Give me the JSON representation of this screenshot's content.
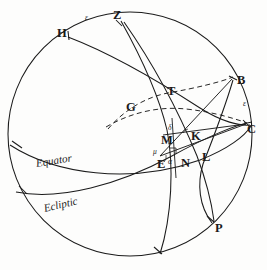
{
  "figure": {
    "kind": "celestial-sphere-diagram",
    "background_color": "#fdfdfc",
    "ink_color": "#1b1b1b",
    "width": 267,
    "height": 270
  },
  "curve_labels": [
    {
      "id": "equator",
      "text": "Equator",
      "x": 36,
      "y": 158,
      "rotate": -9
    },
    {
      "id": "ecliptic",
      "text": "Ecliptic",
      "x": 44,
      "y": 203,
      "rotate": -13
    }
  ],
  "point_labels": [
    {
      "id": "H",
      "text": "H",
      "x": 57,
      "y": 27
    },
    {
      "id": "Z",
      "text": "Z",
      "x": 113,
      "y": 9
    },
    {
      "id": "B",
      "text": "B",
      "x": 237,
      "y": 74
    },
    {
      "id": "C",
      "text": "C",
      "x": 247,
      "y": 123
    },
    {
      "id": "G",
      "text": "G",
      "x": 126,
      "y": 101
    },
    {
      "id": "T",
      "text": "T",
      "x": 167,
      "y": 85
    },
    {
      "id": "M",
      "text": "M",
      "x": 161,
      "y": 134
    },
    {
      "id": "K",
      "text": "K",
      "x": 191,
      "y": 130
    },
    {
      "id": "E",
      "text": "E",
      "x": 157,
      "y": 158
    },
    {
      "id": "N",
      "text": "N",
      "x": 181,
      "y": 157
    },
    {
      "id": "L",
      "text": "L",
      "x": 202,
      "y": 151
    },
    {
      "id": "P",
      "text": "P",
      "x": 215,
      "y": 222
    }
  ],
  "greek_labels": [
    {
      "id": "epsilon-top",
      "text": "ε",
      "x": 85,
      "y": 14
    },
    {
      "id": "epsilon-right",
      "text": "ε",
      "x": 243,
      "y": 100
    },
    {
      "id": "delta",
      "text": "δ",
      "x": 168,
      "y": 124
    },
    {
      "id": "mu",
      "text": "μ",
      "x": 153,
      "y": 148
    },
    {
      "id": "alpha",
      "text": "α",
      "x": 168,
      "y": 158
    }
  ]
}
